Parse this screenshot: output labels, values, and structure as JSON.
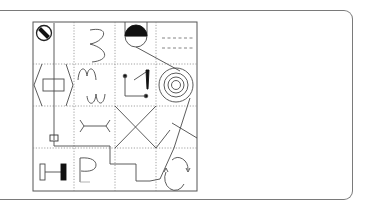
{
  "figure": {
    "title": "",
    "grid": {
      "rows": 4,
      "cols": 4
    },
    "colors": {
      "stroke": "#4a4a4a",
      "grid_dotted": "#8a8a8a",
      "fill_dark": "#111111",
      "frame": "#7a7a7a"
    },
    "cells": [
      [
        "circle-with-diagonal-bar",
        "s-curve",
        "half-filled-circle-on-stem",
        "double-dashed-lines"
      ],
      [
        "hexagon-with-rectangle",
        "m-and-w-waves",
        "dots-with-exclamation",
        "concentric-circles-spiral"
      ],
      [
        "small-box-on-line",
        "double-y-connector",
        "x-crossed-square",
        "diagonal-lines"
      ],
      [
        "dumbbell-with-filled-block",
        "letter-p",
        "stepped-line",
        "circular-arrows"
      ]
    ]
  }
}
